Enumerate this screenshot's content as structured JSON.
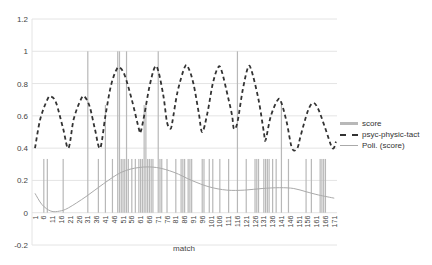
{
  "chart_data": {
    "type": "bar+line",
    "title": "",
    "xlabel": "match",
    "ylabel": "",
    "ylim": [
      -0.2,
      1.2
    ],
    "yticks": [
      "1.2",
      "1",
      "0.8",
      "0.6",
      "0.4",
      "0.2",
      "0",
      "-0.2"
    ],
    "grid": true,
    "legend_position": "right",
    "legend": [
      "score",
      "psyc-physic-tact",
      "Poli. (score)"
    ],
    "x_range": [
      1,
      172
    ],
    "xtick_labels": [
      "1",
      "6",
      "11",
      "16",
      "21",
      "26",
      "31",
      "36",
      "41",
      "46",
      "51",
      "56",
      "61",
      "66",
      "71",
      "76",
      "81",
      "86",
      "91",
      "96",
      "101",
      "106",
      "111",
      "116",
      "121",
      "126",
      "131",
      "136",
      "141",
      "146",
      "151",
      "156",
      "161",
      "166",
      "171"
    ],
    "series": [
      {
        "name": "score",
        "kind": "bar",
        "color": "#b8b8b8",
        "points": [
          [
            6,
            0.333
          ],
          [
            8,
            0.333
          ],
          [
            17,
            0.333
          ],
          [
            31,
            1
          ],
          [
            37,
            0.333
          ],
          [
            41,
            0.667
          ],
          [
            45,
            0.333
          ],
          [
            48,
            1
          ],
          [
            49,
            1
          ],
          [
            50,
            0.333
          ],
          [
            51,
            0.333
          ],
          [
            52,
            0.333
          ],
          [
            53,
            1
          ],
          [
            54,
            0.333
          ],
          [
            56,
            0.333
          ],
          [
            58,
            0.333
          ],
          [
            60,
            0.333
          ],
          [
            61,
            0.333
          ],
          [
            62,
            0.333
          ],
          [
            63,
            0.667
          ],
          [
            64,
            0.667
          ],
          [
            65,
            0.333
          ],
          [
            66,
            0.333
          ],
          [
            67,
            0.333
          ],
          [
            68,
            0.333
          ],
          [
            71,
            1
          ],
          [
            72,
            0.333
          ],
          [
            73,
            0.333
          ],
          [
            76,
            0.333
          ],
          [
            81,
            0.333
          ],
          [
            84,
            0.333
          ],
          [
            85,
            0.333
          ],
          [
            86,
            0.333
          ],
          [
            88,
            0.333
          ],
          [
            89,
            0.333
          ],
          [
            90,
            0.333
          ],
          [
            96,
            0.333
          ],
          [
            97,
            0.333
          ],
          [
            100,
            0.333
          ],
          [
            102,
            0.333
          ],
          [
            106,
            0.333
          ],
          [
            111,
            0.333
          ],
          [
            116,
            1
          ],
          [
            121,
            0.333
          ],
          [
            126,
            0.333
          ],
          [
            127,
            0.333
          ],
          [
            128,
            0.333
          ],
          [
            131,
            0.333
          ],
          [
            132,
            0.333
          ],
          [
            133,
            0.333
          ],
          [
            134,
            0.333
          ],
          [
            136,
            0.333
          ],
          [
            138,
            0.333
          ],
          [
            141,
            0.667
          ],
          [
            145,
            0.333
          ],
          [
            155,
            0.333
          ],
          [
            158,
            0.333
          ],
          [
            163,
            0.333
          ],
          [
            164,
            0.333
          ],
          [
            165,
            0.333
          ],
          [
            166,
            0.333
          ]
        ]
      },
      {
        "name": "psyc-physic-tact",
        "kind": "line",
        "style": "dashed",
        "color": "#333333",
        "points": [
          [
            1,
            0.4
          ],
          [
            4,
            0.58
          ],
          [
            8,
            0.7
          ],
          [
            10,
            0.72
          ],
          [
            13,
            0.68
          ],
          [
            17,
            0.52
          ],
          [
            20,
            0.4
          ],
          [
            23,
            0.58
          ],
          [
            27,
            0.7
          ],
          [
            29,
            0.72
          ],
          [
            32,
            0.66
          ],
          [
            35,
            0.52
          ],
          [
            38,
            0.4
          ],
          [
            41,
            0.6
          ],
          [
            44,
            0.78
          ],
          [
            47,
            0.88
          ],
          [
            49,
            0.9
          ],
          [
            52,
            0.85
          ],
          [
            56,
            0.7
          ],
          [
            60,
            0.52
          ],
          [
            61,
            0.5
          ],
          [
            63,
            0.6
          ],
          [
            66,
            0.78
          ],
          [
            69,
            0.9
          ],
          [
            71,
            0.88
          ],
          [
            74,
            0.72
          ],
          [
            76,
            0.56
          ],
          [
            78,
            0.52
          ],
          [
            79,
            0.56
          ],
          [
            82,
            0.75
          ],
          [
            86,
            0.9
          ],
          [
            88,
            0.9
          ],
          [
            91,
            0.8
          ],
          [
            94,
            0.62
          ],
          [
            96,
            0.5
          ],
          [
            99,
            0.62
          ],
          [
            102,
            0.8
          ],
          [
            105,
            0.9
          ],
          [
            107,
            0.88
          ],
          [
            111,
            0.7
          ],
          [
            113,
            0.6
          ],
          [
            114,
            0.52
          ],
          [
            116,
            0.56
          ],
          [
            119,
            0.76
          ],
          [
            122,
            0.9
          ],
          [
            124,
            0.88
          ],
          [
            128,
            0.7
          ],
          [
            131,
            0.5
          ],
          [
            132,
            0.45
          ],
          [
            135,
            0.6
          ],
          [
            139,
            0.7
          ],
          [
            141,
            0.68
          ],
          [
            144,
            0.56
          ],
          [
            147,
            0.4
          ],
          [
            150,
            0.4
          ],
          [
            152,
            0.48
          ],
          [
            156,
            0.63
          ],
          [
            159,
            0.68
          ],
          [
            162,
            0.64
          ],
          [
            166,
            0.52
          ],
          [
            170,
            0.4
          ],
          [
            172,
            0.44
          ]
        ]
      },
      {
        "name": "Poli. (score)",
        "kind": "line",
        "style": "solid",
        "color": "#aaaaaa",
        "points": [
          [
            1,
            0.12
          ],
          [
            5,
            0.05
          ],
          [
            10,
            0.01
          ],
          [
            15,
            0.01
          ],
          [
            20,
            0.03
          ],
          [
            30,
            0.1
          ],
          [
            40,
            0.18
          ],
          [
            50,
            0.25
          ],
          [
            60,
            0.28
          ],
          [
            70,
            0.28
          ],
          [
            80,
            0.25
          ],
          [
            90,
            0.2
          ],
          [
            100,
            0.16
          ],
          [
            110,
            0.14
          ],
          [
            120,
            0.14
          ],
          [
            130,
            0.15
          ],
          [
            140,
            0.155
          ],
          [
            148,
            0.15
          ],
          [
            155,
            0.13
          ],
          [
            162,
            0.11
          ],
          [
            171,
            0.09
          ]
        ]
      }
    ]
  }
}
